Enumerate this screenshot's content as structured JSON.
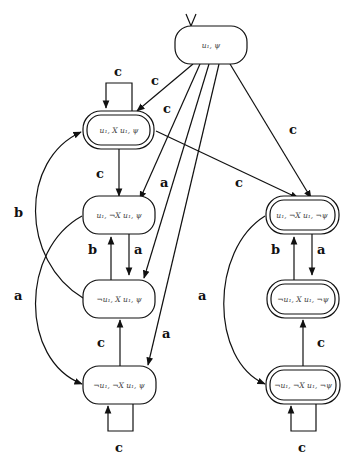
{
  "diagram": {
    "type": "automaton",
    "nodes": [
      {
        "id": "n0",
        "label": "u₁, ψ",
        "accepting": false,
        "initial": true
      },
      {
        "id": "n1",
        "label": "u₁, X u₁, ψ",
        "accepting": true
      },
      {
        "id": "n2",
        "label": "u₁, ¬X u₁, ψ",
        "accepting": false
      },
      {
        "id": "n3",
        "label": "¬u₁, X u₁, ψ",
        "accepting": false
      },
      {
        "id": "n4",
        "label": "¬u₁, ¬X u₁, ψ",
        "accepting": false
      },
      {
        "id": "n5",
        "label": "u₁, ¬X u₁, ¬ψ",
        "accepting": true
      },
      {
        "id": "n6",
        "label": "¬u₁, X u₁, ¬ψ",
        "accepting": true
      },
      {
        "id": "n7",
        "label": "¬u₁, ¬X u₁, ¬ψ",
        "accepting": true
      }
    ],
    "edges": [
      {
        "from": "n0",
        "to": "n1",
        "label": "c"
      },
      {
        "from": "n0",
        "to": "n2",
        "label": "c"
      },
      {
        "from": "n0",
        "to": "n3",
        "label": "a"
      },
      {
        "from": "n0",
        "to": "n4",
        "label": "a"
      },
      {
        "from": "n0",
        "to": "n5",
        "label": "c"
      },
      {
        "from": "n1",
        "to": "n1",
        "label": "c"
      },
      {
        "from": "n1",
        "to": "n2",
        "label": "c"
      },
      {
        "from": "n1",
        "to": "n5",
        "label": "c"
      },
      {
        "from": "n2",
        "to": "n3",
        "label": "a"
      },
      {
        "from": "n3",
        "to": "n2",
        "label": "b"
      },
      {
        "from": "n3",
        "to": "n1",
        "label": "b"
      },
      {
        "from": "n2",
        "to": "n4",
        "label": "a"
      },
      {
        "from": "n4",
        "to": "n3",
        "label": "c"
      },
      {
        "from": "n4",
        "to": "n4",
        "label": "c"
      },
      {
        "from": "n5",
        "to": "n6",
        "label": "a"
      },
      {
        "from": "n6",
        "to": "n5",
        "label": "b"
      },
      {
        "from": "n5",
        "to": "n7",
        "label": "a"
      },
      {
        "from": "n7",
        "to": "n6",
        "label": "c"
      },
      {
        "from": "n7",
        "to": "n7",
        "label": "c"
      }
    ]
  },
  "labels": {
    "n0": "u₁, ψ",
    "n1": "u₁, X u₁, ψ",
    "n2": "u₁, ¬X u₁, ψ",
    "n3": "¬u₁, X u₁, ψ",
    "n4": "¬u₁, ¬X u₁, ψ",
    "n5": "u₁, ¬X u₁, ¬ψ",
    "n6": "¬u₁, X u₁, ¬ψ",
    "n7": "¬u₁, ¬X u₁, ¬ψ",
    "a": "a",
    "b": "b",
    "c": "c"
  }
}
